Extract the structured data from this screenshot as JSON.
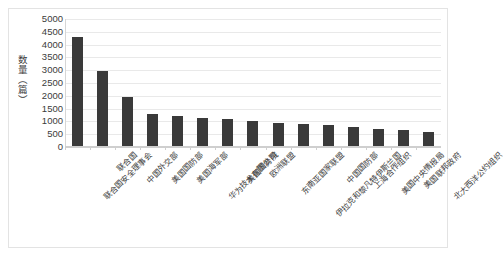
{
  "chart_data": {
    "type": "bar",
    "title": "",
    "subtitle": "",
    "xlabel": "",
    "ylabel": "数量（篇）",
    "ylim": [
      0,
      5000
    ],
    "ytick_step": 500,
    "yticks": [
      "5000",
      "4500",
      "4000",
      "3500",
      "3000",
      "2500",
      "2000",
      "1500",
      "1000",
      "500",
      "0"
    ],
    "grid": true,
    "legend": false,
    "legend_position": "none",
    "bar_color": "#3a3a3a",
    "categories": [
      "联合国安全理事会",
      "联合国",
      "中国外交部",
      "美国国防部",
      "美国海军部",
      "华为技术有限公司",
      "美国国务院",
      "欧洲联盟",
      "东南亚国家联盟",
      "伊拉克和黎凡特伊斯兰国",
      "中国国防部",
      "上海合作组织",
      "美国中央情报局",
      "美国联邦政府",
      "北大西洋公约组织"
    ],
    "values": [
      4300,
      2950,
      1950,
      1300,
      1200,
      1150,
      1100,
      1000,
      950,
      900,
      850,
      780,
      700,
      650,
      600
    ]
  },
  "axis": {
    "y_title": "数量（篇）"
  }
}
